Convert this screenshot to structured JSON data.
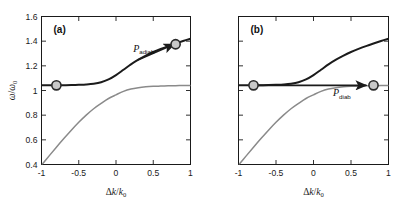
{
  "figure": {
    "width": 420,
    "height": 211,
    "background": "#ffffff",
    "panels": [
      {
        "id": "a",
        "label": "(a)",
        "annotation": {
          "symbol": "P",
          "subscript": "adiab",
          "full": "P_adiab"
        },
        "trajectory": "adiabatic"
      },
      {
        "id": "b",
        "label": "(b)",
        "annotation": {
          "symbol": "P",
          "subscript": "diab",
          "full": "P_diab"
        },
        "trajectory": "diabatic"
      }
    ]
  },
  "colors": {
    "upper_branch": "#1b1b1b",
    "lower_branch": "#8a8a8a",
    "marker_fill": "#c9c9c9",
    "marker_stroke": "#2a2a2a",
    "axis": "#1a1a1a",
    "arrow": "#1b1b1b"
  },
  "chart_data": {
    "type": "line",
    "title": "",
    "subtitle": "",
    "xlabel": "Δk/k₀",
    "ylabel": "ω/ω₀",
    "xlim": [
      -1,
      1
    ],
    "ylim": [
      0.4,
      1.6
    ],
    "xticks": [
      -1,
      -0.5,
      0,
      0.5,
      1
    ],
    "xticklabels": [
      "-1",
      "-0.5",
      "0",
      "0.5",
      "1"
    ],
    "yticks": [
      0.4,
      0.6,
      0.8,
      1,
      1.2,
      1.4,
      1.6
    ],
    "yticklabels": [
      "0.4",
      "0.6",
      "0.8",
      "1",
      "1.2",
      "1.4",
      "1.6"
    ],
    "yticklabels_visible_panels": [
      "a"
    ],
    "grid": false,
    "legend": false,
    "panels": [
      {
        "id": "a",
        "label": "(a)",
        "series": [
          {
            "name": "upper-branch",
            "color": "#1b1b1b",
            "x": [
              -1.0,
              -0.9,
              -0.8,
              -0.7,
              -0.6,
              -0.5,
              -0.4,
              -0.3,
              -0.2,
              -0.1,
              0.0,
              0.1,
              0.2,
              0.3,
              0.4,
              0.5,
              0.6,
              0.7,
              0.8,
              0.9,
              1.0
            ],
            "y": [
              1.042,
              1.042,
              1.042,
              1.043,
              1.044,
              1.046,
              1.049,
              1.055,
              1.067,
              1.09,
              1.125,
              1.168,
              1.212,
              1.25,
              1.283,
              1.312,
              1.337,
              1.36,
              1.381,
              1.401,
              1.42
            ]
          },
          {
            "name": "lower-branch",
            "color": "#8a8a8a",
            "x": [
              -1.0,
              -0.9,
              -0.8,
              -0.7,
              -0.6,
              -0.5,
              -0.4,
              -0.3,
              -0.2,
              -0.1,
              0.0,
              0.1,
              0.2,
              0.3,
              0.4,
              0.5,
              0.6,
              0.7,
              0.8,
              0.9,
              1.0
            ],
            "y": [
              0.395,
              0.468,
              0.54,
              0.61,
              0.678,
              0.742,
              0.8,
              0.852,
              0.895,
              0.935,
              0.965,
              0.993,
              1.012,
              1.023,
              1.03,
              1.034,
              1.036,
              1.038,
              1.039,
              1.04,
              1.04
            ]
          }
        ],
        "trajectory": {
          "name": "adiabatic-path",
          "follows": "upper-branch",
          "arrow_from": [
            0.3,
            1.25
          ],
          "arrow_to": [
            0.78,
            1.375
          ],
          "label": "P_adiab",
          "label_x": 0.23,
          "label_y": 1.315
        },
        "markers": [
          {
            "name": "start-marker",
            "x": -0.8,
            "y": 1.042
          },
          {
            "name": "end-marker",
            "x": 0.8,
            "y": 1.375
          }
        ]
      },
      {
        "id": "b",
        "label": "(b)",
        "series": [
          {
            "name": "upper-branch",
            "color": "#1b1b1b",
            "x": [
              -1.0,
              -0.9,
              -0.8,
              -0.7,
              -0.6,
              -0.5,
              -0.4,
              -0.3,
              -0.2,
              -0.1,
              0.0,
              0.1,
              0.2,
              0.3,
              0.4,
              0.5,
              0.6,
              0.7,
              0.8,
              0.9,
              1.0
            ],
            "y": [
              1.042,
              1.042,
              1.042,
              1.043,
              1.044,
              1.046,
              1.049,
              1.055,
              1.067,
              1.09,
              1.125,
              1.168,
              1.212,
              1.25,
              1.283,
              1.312,
              1.337,
              1.36,
              1.381,
              1.401,
              1.42
            ]
          },
          {
            "name": "lower-branch",
            "color": "#8a8a8a",
            "x": [
              -1.0,
              -0.9,
              -0.8,
              -0.7,
              -0.6,
              -0.5,
              -0.4,
              -0.3,
              -0.2,
              -0.1,
              0.0,
              0.1,
              0.2,
              0.3,
              0.4,
              0.5,
              0.6,
              0.7,
              0.8,
              0.9,
              1.0
            ],
            "y": [
              0.395,
              0.468,
              0.54,
              0.61,
              0.678,
              0.742,
              0.8,
              0.852,
              0.895,
              0.935,
              0.965,
              0.993,
              1.012,
              1.023,
              1.03,
              1.034,
              1.036,
              1.038,
              1.039,
              1.04,
              1.04
            ]
          }
        ],
        "trajectory": {
          "name": "diabatic-path",
          "follows": "horizontal",
          "arrow_from": [
            -0.8,
            1.042
          ],
          "arrow_to": [
            0.7,
            1.042
          ],
          "label": "P_diab",
          "label_x": 0.26,
          "label_y": 0.955
        },
        "markers": [
          {
            "name": "start-marker",
            "x": -0.8,
            "y": 1.042
          },
          {
            "name": "end-marker",
            "x": 0.8,
            "y": 1.042
          }
        ]
      }
    ]
  }
}
